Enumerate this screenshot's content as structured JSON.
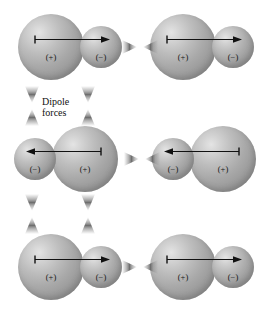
{
  "figure": {
    "background_color": "#ffffff",
    "width": 275,
    "height": 313
  },
  "labels": {
    "force_label_line1": "Dipole",
    "force_label_line2": "forces",
    "positive_charge": "(+)",
    "negative_charge": "(−)"
  },
  "colors": {
    "sphere_highlight": "#e4e4e4",
    "sphere_midtone": "#a9a9a9",
    "sphere_shadow": "#888888",
    "arrow_stroke": "#111111",
    "force_arrow_fill": "#9d9d9d",
    "text": "#151515"
  },
  "molecules": [
    {
      "id": "molecule-top-left",
      "row": 1,
      "column": 1,
      "orientation": "right",
      "big_atom": {
        "charge": "(+)",
        "side": "left",
        "radius": 33
      },
      "small_atom": {
        "charge": "(−)",
        "side": "right",
        "radius": 21
      }
    },
    {
      "id": "molecule-top-right",
      "row": 1,
      "column": 2,
      "orientation": "right",
      "big_atom": {
        "charge": "(+)",
        "side": "left",
        "radius": 33
      },
      "small_atom": {
        "charge": "(−)",
        "side": "right",
        "radius": 21
      }
    },
    {
      "id": "molecule-middle-left",
      "row": 2,
      "column": 1,
      "orientation": "left",
      "big_atom": {
        "charge": "(+)",
        "side": "right",
        "radius": 33
      },
      "small_atom": {
        "charge": "(−)",
        "side": "left",
        "radius": 21
      }
    },
    {
      "id": "molecule-middle-right",
      "row": 2,
      "column": 2,
      "orientation": "left",
      "big_atom": {
        "charge": "(+)",
        "side": "right",
        "radius": 33
      },
      "small_atom": {
        "charge": "(−)",
        "side": "left",
        "radius": 21
      }
    },
    {
      "id": "molecule-bottom-left",
      "row": 3,
      "column": 1,
      "orientation": "right",
      "big_atom": {
        "charge": "(+)",
        "side": "left",
        "radius": 33
      },
      "small_atom": {
        "charge": "(−)",
        "side": "right",
        "radius": 21
      }
    },
    {
      "id": "molecule-bottom-right",
      "row": 3,
      "column": 2,
      "orientation": "right",
      "big_atom": {
        "charge": "(+)",
        "side": "left",
        "radius": 33
      },
      "small_atom": {
        "charge": "(−)",
        "side": "right",
        "radius": 21
      }
    }
  ],
  "force_arrows": {
    "horizontal_count": 3,
    "vertical_count": 4,
    "description": "double-headed attractive force indicators"
  }
}
